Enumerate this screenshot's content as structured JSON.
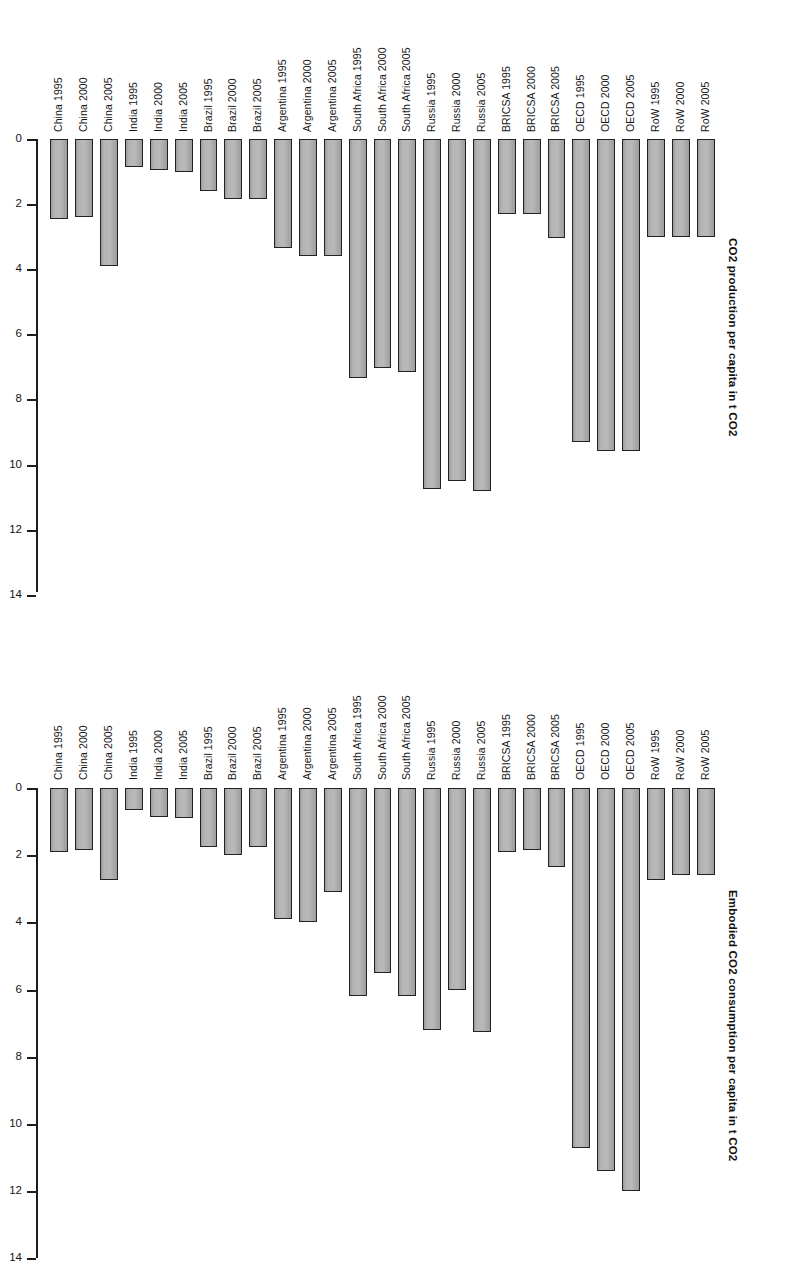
{
  "figure": {
    "background": "#ffffff",
    "bar_fill": "#b0b0b0",
    "bar_stroke": "#222222",
    "axis_color": "#1d1d1d"
  },
  "chart_data": [
    {
      "id": "co2-production",
      "type": "bar",
      "title": "",
      "ylabel": "CO2 production per capita in t CO2",
      "xlabel": "",
      "orientation": "vertical-inverted",
      "ylim": [
        0,
        14
      ],
      "y_inverted": true,
      "grid": false,
      "legend": "none",
      "tick_labels": [
        "0",
        "2",
        "4",
        "6",
        "8",
        "10",
        "12",
        "14"
      ],
      "tick_values": [
        0,
        2,
        4,
        6,
        8,
        10,
        12,
        14
      ],
      "categories": [
        "China 1995",
        "China 2000",
        "China 2005",
        "India 1995",
        "India 2000",
        "India 2005",
        "Brazil 1995",
        "Brazil 2000",
        "Brazil 2005",
        "Argentina 1995",
        "Argentina 2000",
        "Argentina 2005",
        "South Africa 1995",
        "South Africa 2000",
        "South Africa 2005",
        "Russia 1995",
        "Russia 2000",
        "Russia 2005",
        "BRICSA 1995",
        "BRICSA 2000",
        "BRICSA 2005",
        "OECD 1995",
        "OECD 2000",
        "OECD 2005",
        "RoW 1995",
        "RoW 2000",
        "RoW 2005"
      ],
      "values": [
        2.45,
        2.4,
        3.9,
        0.85,
        0.95,
        1.0,
        1.6,
        1.85,
        1.85,
        3.35,
        3.6,
        3.6,
        7.35,
        7.05,
        7.15,
        10.75,
        10.5,
        10.8,
        2.3,
        2.3,
        3.05,
        9.3,
        9.6,
        9.6,
        3.0,
        3.0,
        3.0
      ]
    },
    {
      "id": "co2-consumption",
      "type": "bar",
      "title": "",
      "ylabel": "Embodied CO2 consumption per capita in t CO2",
      "xlabel": "",
      "orientation": "vertical-inverted",
      "ylim": [
        0,
        14
      ],
      "y_inverted": true,
      "grid": false,
      "legend": "none",
      "tick_labels": [
        "0",
        "2",
        "4",
        "6",
        "8",
        "10",
        "12",
        "14"
      ],
      "tick_values": [
        0,
        2,
        4,
        6,
        8,
        10,
        12,
        14
      ],
      "categories": [
        "China 1995",
        "China 2000",
        "China 2005",
        "India 1995",
        "India 2000",
        "India 2005",
        "Brazil 1995",
        "Brazil 2000",
        "Brazil 2005",
        "Argentina 1995",
        "Argentina 2000",
        "Argentina 2005",
        "South Africa 1995",
        "South Africa 2000",
        "South Africa 2005",
        "Russia 1995",
        "Russia 2000",
        "Russia 2005",
        "BRICSA 1995",
        "BRICSA 2000",
        "BRICSA 2005",
        "OECD 1995",
        "OECD 2000",
        "OECD 2005",
        "RoW 1995",
        "RoW 2000",
        "RoW 2005"
      ],
      "values": [
        1.9,
        1.85,
        2.75,
        0.65,
        0.85,
        0.9,
        1.75,
        2.0,
        1.75,
        3.9,
        4.0,
        3.1,
        6.2,
        5.5,
        6.2,
        7.2,
        6.0,
        7.25,
        1.9,
        1.85,
        2.35,
        10.7,
        11.4,
        12.0,
        2.75,
        2.6,
        2.6
      ]
    }
  ]
}
